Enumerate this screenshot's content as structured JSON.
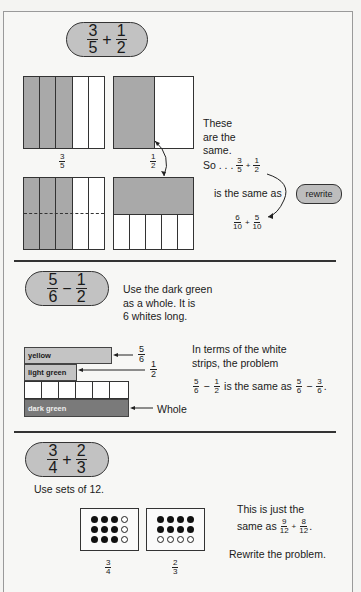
{
  "section1": {
    "problem": {
      "a_num": "3",
      "a_den": "5",
      "op": "+",
      "b_num": "1",
      "b_den": "2"
    },
    "label_left": {
      "num": "3",
      "den": "5"
    },
    "label_right": {
      "num": "1",
      "den": "2"
    },
    "text_lines": [
      "These",
      "are the",
      "same."
    ],
    "so_text": "So . . .",
    "so_frac": {
      "a_num": "3",
      "a_den": "5",
      "op": "+",
      "b_num": "1",
      "b_den": "2"
    },
    "same_as": "is the same as",
    "cloud_label": "rewrite",
    "result": {
      "a_num": "6",
      "a_den": "10",
      "op": "+",
      "b_num": "5",
      "b_den": "10"
    }
  },
  "section2": {
    "problem": {
      "a_num": "5",
      "a_den": "6",
      "op": "−",
      "b_num": "1",
      "b_den": "2"
    },
    "instructions": [
      "Use the dark green",
      "as a whole. It is",
      "6 whites long."
    ],
    "bars": {
      "yellow": "yellow",
      "light_green": "light green",
      "dark_green": "dark green"
    },
    "arrow_labels": {
      "yellow": {
        "num": "5",
        "den": "6"
      },
      "light_green": {
        "num": "1",
        "den": "2"
      },
      "whole": "Whole"
    },
    "terms_text": [
      "In terms of the white",
      "strips, the problem"
    ],
    "equation": {
      "a": {
        "num": "5",
        "den": "6"
      },
      "op1": "−",
      "b": {
        "num": "1",
        "den": "2"
      },
      "middle": "is the same as",
      "c": {
        "num": "5",
        "den": "6"
      },
      "op2": "−",
      "d": {
        "num": "3",
        "den": "6"
      },
      "end": "."
    }
  },
  "section3": {
    "problem": {
      "a_num": "3",
      "a_den": "4",
      "op": "+",
      "b_num": "2",
      "b_den": "3"
    },
    "instruction": "Use sets of 12.",
    "label_left": {
      "num": "3",
      "den": "4"
    },
    "label_right": {
      "num": "2",
      "den": "3"
    },
    "text_line1": "This is just the",
    "text_line2": "same as",
    "result": {
      "a_num": "9",
      "a_den": "12",
      "op": "+",
      "b_num": "8",
      "b_den": "12",
      "end": "."
    },
    "rewrite_text": "Rewrite the problem."
  }
}
